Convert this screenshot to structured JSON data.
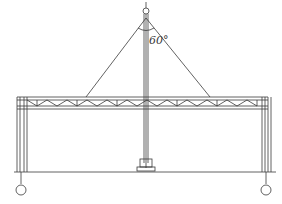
{
  "diagram": {
    "angle_label": "60°",
    "colors": {
      "line": "#3a3a3a",
      "background": "#ffffff"
    },
    "labels": {
      "left_axis_marker": "",
      "right_axis_marker": "",
      "top_marker": ""
    },
    "components": [
      "central-mast",
      "guy-cables",
      "roof-truss",
      "left-column",
      "right-column",
      "mast-base",
      "ground-line",
      "axis-markers"
    ]
  }
}
